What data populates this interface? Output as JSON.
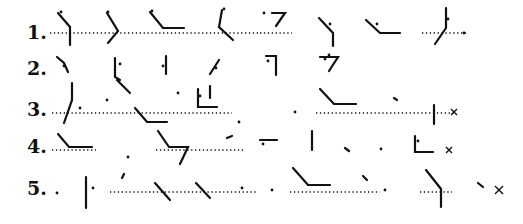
{
  "figure": {
    "rows": [
      {
        "label": "1.",
        "y": 33,
        "baseline_y": 33
      },
      {
        "label": "2.",
        "y": 70
      },
      {
        "label": "3.",
        "y": 112
      },
      {
        "label": "4.",
        "y": 148
      },
      {
        "label": "5.",
        "y": 192
      }
    ],
    "ink_color": "#111111",
    "dotted_lines": [
      {
        "row": 1,
        "x1": 50,
        "x2": 258,
        "y": 33
      },
      {
        "row": 1,
        "x1": 260,
        "x2": 292,
        "y": 33
      },
      {
        "row": 1,
        "x1": 422,
        "x2": 466,
        "y": 33
      },
      {
        "row": 3,
        "x1": 52,
        "x2": 232,
        "y": 113
      },
      {
        "row": 3,
        "x1": 316,
        "x2": 455,
        "y": 113
      },
      {
        "row": 4,
        "x1": 52,
        "x2": 96,
        "y": 150
      },
      {
        "row": 4,
        "x1": 156,
        "x2": 245,
        "y": 150
      },
      {
        "row": 5,
        "x1": 110,
        "x2": 258,
        "y": 192
      },
      {
        "row": 5,
        "x1": 290,
        "x2": 380,
        "y": 192
      },
      {
        "row": 5,
        "x1": 420,
        "x2": 452,
        "y": 192
      }
    ],
    "marks": [
      "M58 13 L70 27 L70 45",
      "M107 13 L118 31 L108 43",
      "M150 12 L163 28 L184 28",
      "M222 10 L219 27 L233 40",
      "M272 13 L285 13 L276 26",
      "M319 18 L333 33 L333 46",
      "M366 20 L380 33 L400 33",
      "M446 8 L446 28 L435 44",
      "M57 57 L64 63 L68 72",
      "M115 58 L115 77 L120 80",
      "M166 56 L166 74",
      "M219 60 L210 74",
      "M266 56 L276 56 L276 75",
      "M320 57 L338 57 L329 71",
      "M72 83 L72 100 L64 123",
      "M117 80 L130 93",
      "M135 108 L147 122 L167 122",
      "M210 86 L210 98",
      "M198 89 L198 107 L217 107",
      "M320 89 L334 104 L356 104",
      "M394 98 L397 100",
      "M434 105 L434 124",
      "M58 134 L69 147 L92 147",
      "M158 131 L169 147 L188 147 L180 164",
      "M227 138 L232 136",
      "M260 140 L277 140",
      "M312 131 L312 150",
      "M345 148 L349 151",
      "M415 136 L415 152 L433 152",
      "M86 177 L86 208",
      "M122 178 L124 174",
      "M155 183 L170 200",
      "M196 183 L210 198",
      "M293 168 L308 185 L330 185",
      "M363 176 L367 180",
      "M426 170 L441 189 L441 207",
      "M478 183 L483 187"
    ],
    "dots": [
      [
        61,
        12
      ],
      [
        108,
        12
      ],
      [
        152,
        11
      ],
      [
        224,
        9
      ],
      [
        264,
        13
      ],
      [
        330,
        24
      ],
      [
        377,
        24
      ],
      [
        448,
        19
      ],
      [
        464,
        33
      ],
      [
        64,
        66
      ],
      [
        120,
        64
      ],
      [
        163,
        66
      ],
      [
        216,
        68
      ],
      [
        268,
        61
      ],
      [
        325,
        59
      ],
      [
        329,
        55
      ],
      [
        107,
        100
      ],
      [
        178,
        93
      ],
      [
        80,
        108
      ],
      [
        200,
        96
      ],
      [
        295,
        112
      ],
      [
        239,
        122
      ],
      [
        128,
        157
      ],
      [
        263,
        144
      ],
      [
        381,
        149
      ],
      [
        418,
        141
      ],
      [
        57,
        193
      ],
      [
        93,
        188
      ],
      [
        242,
        188
      ],
      [
        272,
        190
      ],
      [
        385,
        190
      ]
    ],
    "crosses": [
      {
        "x": 454,
        "y": 112,
        "size": 3
      },
      {
        "x": 449,
        "y": 150,
        "size": 3
      },
      {
        "x": 499,
        "y": 190,
        "size": 4
      }
    ]
  }
}
